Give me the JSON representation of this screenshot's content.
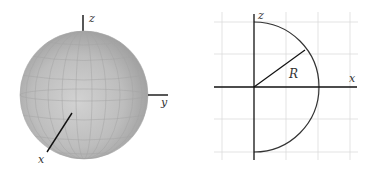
{
  "left_figure": {
    "type": "sphere-3d",
    "axis_labels": {
      "z": "z",
      "y": "y",
      "x": "x"
    },
    "colors": {
      "sphere_fill": "#a9a9a9",
      "sphere_highlight": "#cfcfcf",
      "axis": "#111111",
      "grid_line": "#9a9a9a"
    }
  },
  "right_figure": {
    "type": "semicircle-cross-section",
    "axis_labels": {
      "z": "z",
      "x": "x"
    },
    "radius_label": "R",
    "colors": {
      "grid": "#dddddd",
      "axis": "#111111",
      "arc": "#333333"
    }
  }
}
